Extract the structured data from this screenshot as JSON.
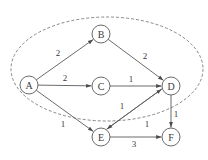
{
  "diagram": {
    "type": "weighted-directed-graph",
    "node_radius": 9,
    "nodes": [
      {
        "id": "A",
        "label": "A",
        "x": 29,
        "y": 85
      },
      {
        "id": "B",
        "label": "B",
        "x": 101,
        "y": 34
      },
      {
        "id": "C",
        "label": "C",
        "x": 101,
        "y": 86
      },
      {
        "id": "D",
        "label": "D",
        "x": 171,
        "y": 86
      },
      {
        "id": "E",
        "label": "E",
        "x": 101,
        "y": 137
      },
      {
        "id": "F",
        "label": "F",
        "x": 171,
        "y": 137
      }
    ],
    "edges": [
      {
        "from": "A",
        "to": "B",
        "weight": "2",
        "lx": 58,
        "ly": 53
      },
      {
        "from": "A",
        "to": "C",
        "weight": "2",
        "lx": 65,
        "ly": 78
      },
      {
        "from": "A",
        "to": "E",
        "weight": "1",
        "lx": 63,
        "ly": 124
      },
      {
        "from": "B",
        "to": "D",
        "weight": "2",
        "lx": 145,
        "ly": 56
      },
      {
        "from": "C",
        "to": "D",
        "weight": "1",
        "lx": 131,
        "ly": 79
      },
      {
        "from": "E",
        "to": "D",
        "weight": "1",
        "lx": 122,
        "ly": 106,
        "offset": -3
      },
      {
        "from": "D",
        "to": "E",
        "weight": "1",
        "lx": 147,
        "ly": 124,
        "offset": 3
      },
      {
        "from": "D",
        "to": "F",
        "weight": "1",
        "lx": 176,
        "ly": 114
      },
      {
        "from": "E",
        "to": "F",
        "weight": "3",
        "lx": 134,
        "ly": 144
      }
    ],
    "boundary": {
      "shape": "dashed-ellipse",
      "cx": 107,
      "cy": 69,
      "rx": 96,
      "ry": 52
    },
    "colors": {
      "stroke": "#5a5a5a",
      "text": "#3a3a3a",
      "background": "#ffffff"
    }
  }
}
